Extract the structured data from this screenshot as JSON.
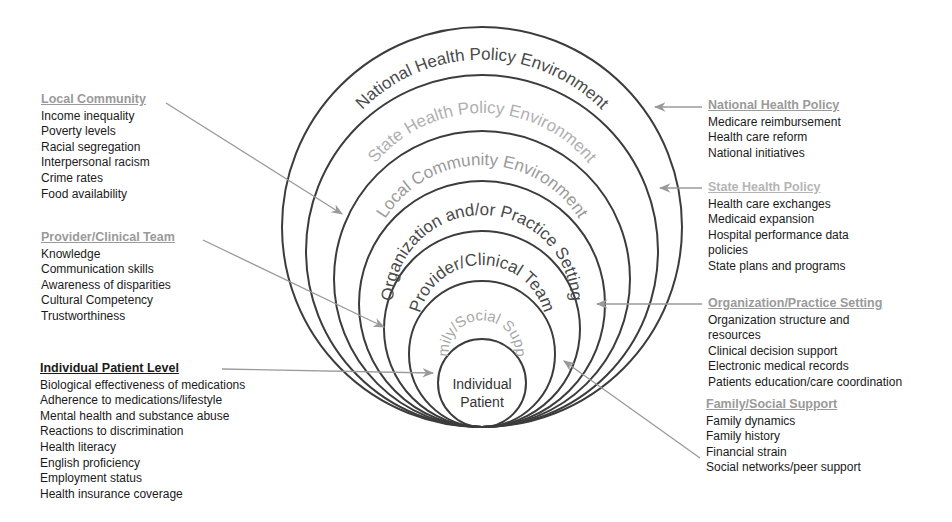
{
  "diagram": {
    "center_x": 482,
    "bottom_y": 427,
    "rings": [
      {
        "name": "national",
        "label": "National Health Policy Environment",
        "radius": 200,
        "label_color": "#4a4a4a",
        "font_size": 17
      },
      {
        "name": "state",
        "label": "State Health Policy Environment",
        "radius": 176,
        "label_color": "#b0b0b0",
        "font_size": 17
      },
      {
        "name": "local",
        "label": "Local Community Environment",
        "radius": 148,
        "label_color": "#9a9a9a",
        "font_size": 17
      },
      {
        "name": "organization",
        "label": "Organization and/or Practice Setting",
        "radius": 123,
        "label_color": "#4a4a4a",
        "font_size": 17
      },
      {
        "name": "provider",
        "label": "Provider/Clinical Team",
        "radius": 98,
        "label_color": "#4a4a4a",
        "font_size": 17
      },
      {
        "name": "family",
        "label": "Family/Social Support",
        "radius": 73,
        "label_color": "#a8a8a8",
        "font_size": 15
      },
      {
        "name": "individual",
        "label": "",
        "radius": 44,
        "label_color": "#333333",
        "font_size": 14
      }
    ],
    "center_label": [
      "Individual",
      "Patient"
    ],
    "stroke_color": "#3c3c3c",
    "arrow_color": "#9a9a9a"
  },
  "panels": {
    "local_community": {
      "heading": "Local Community",
      "items": [
        "Income inequality",
        "Poverty levels",
        "Racial segregation",
        "Interpersonal racism",
        "Crime rates",
        "Food availability"
      ]
    },
    "provider_team": {
      "heading": "Provider/Clinical Team",
      "items": [
        "Knowledge",
        "Communication skills",
        "Awareness of disparities",
        "Cultural Competency",
        "Trustworthiness"
      ]
    },
    "individual_patient": {
      "heading": "Individual Patient Level",
      "items": [
        "Biological effectiveness of medications",
        "Adherence to medications/lifestyle",
        "Mental health and substance abuse",
        "Reactions to discrimination",
        "Health literacy",
        "English proficiency",
        "Employment status",
        "Health insurance coverage"
      ]
    },
    "national_policy": {
      "heading": "National Health Policy",
      "items": [
        "Medicare reimbursement",
        "Health care reform",
        "National initiatives"
      ]
    },
    "state_policy": {
      "heading": "State Health Policy",
      "items": [
        "Health care exchanges",
        "Medicaid expansion",
        "Hospital performance data",
        "policies",
        "State plans and programs"
      ]
    },
    "organization_setting": {
      "heading": "Organization/Practice Setting",
      "items": [
        "Organization structure and",
        "resources",
        "Clinical decision support",
        "Electronic medical records",
        "Patients education/care coordination"
      ]
    },
    "family_support": {
      "heading": "Family/Social Support",
      "items": [
        "Family dynamics",
        "Family history",
        "Financial strain",
        "Social networks/peer support"
      ]
    }
  },
  "arrows": [
    {
      "name": "local-community-arrow",
      "x1": 166,
      "y1": 103,
      "x2": 342,
      "y2": 214
    },
    {
      "name": "provider-team-arrow",
      "x1": 203,
      "y1": 240,
      "x2": 384,
      "y2": 327
    },
    {
      "name": "individual-patient-arrow",
      "x1": 222,
      "y1": 369,
      "x2": 433,
      "y2": 373
    },
    {
      "name": "national-policy-arrow",
      "x1": 702,
      "y1": 107,
      "x2": 655,
      "y2": 107
    },
    {
      "name": "state-policy-arrow",
      "x1": 702,
      "y1": 188,
      "x2": 660,
      "y2": 188
    },
    {
      "name": "organization-setting-arrow",
      "x1": 702,
      "y1": 304,
      "x2": 597,
      "y2": 304
    },
    {
      "name": "family-support-arrow",
      "x1": 700,
      "y1": 458,
      "x2": 564,
      "y2": 361
    }
  ]
}
